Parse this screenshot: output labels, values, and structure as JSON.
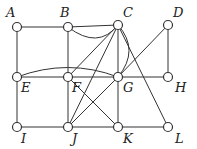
{
  "diagram": {
    "type": "graph",
    "nodes": [
      {
        "id": "A",
        "label": "A",
        "x": 17,
        "y": 27,
        "lx": 6,
        "ly": 17
      },
      {
        "id": "B",
        "label": "B",
        "x": 68,
        "y": 27,
        "lx": 60,
        "ly": 17
      },
      {
        "id": "C",
        "label": "C",
        "x": 118,
        "y": 25,
        "lx": 123,
        "ly": 17
      },
      {
        "id": "D",
        "label": "D",
        "x": 168,
        "y": 25,
        "lx": 173,
        "ly": 17
      },
      {
        "id": "E",
        "label": "E",
        "x": 17,
        "y": 77,
        "lx": 21,
        "ly": 92
      },
      {
        "id": "F",
        "label": "F",
        "x": 68,
        "y": 77,
        "lx": 72,
        "ly": 92
      },
      {
        "id": "G",
        "label": "G",
        "x": 118,
        "y": 77,
        "lx": 123,
        "ly": 92
      },
      {
        "id": "H",
        "label": "H",
        "x": 168,
        "y": 77,
        "lx": 175,
        "ly": 92
      },
      {
        "id": "I",
        "label": "I",
        "x": 17,
        "y": 127,
        "lx": 21,
        "ly": 143
      },
      {
        "id": "J",
        "label": "J",
        "x": 68,
        "y": 127,
        "lx": 72,
        "ly": 143
      },
      {
        "id": "K",
        "label": "K",
        "x": 118,
        "y": 127,
        "lx": 123,
        "ly": 143
      },
      {
        "id": "L",
        "label": "L",
        "x": 168,
        "y": 127,
        "lx": 175,
        "ly": 143
      }
    ],
    "edges": [
      {
        "from": "A",
        "to": "B"
      },
      {
        "from": "B",
        "to": "C"
      },
      {
        "from": "B",
        "to": "C",
        "curved": true,
        "ctrl": [
          98,
          50
        ]
      },
      {
        "from": "A",
        "to": "E"
      },
      {
        "from": "B",
        "to": "F"
      },
      {
        "from": "C",
        "to": "F"
      },
      {
        "from": "C",
        "to": "G"
      },
      {
        "from": "C",
        "to": "G",
        "curved": true,
        "ctrl": [
          140,
          50
        ]
      },
      {
        "from": "C",
        "to": "L"
      },
      {
        "from": "C",
        "to": "J"
      },
      {
        "from": "D",
        "to": "G"
      },
      {
        "from": "D",
        "to": "H"
      },
      {
        "from": "E",
        "to": "F"
      },
      {
        "from": "E",
        "to": "G",
        "curved": true,
        "ctrl": [
          68,
          58
        ]
      },
      {
        "from": "F",
        "to": "G"
      },
      {
        "from": "G",
        "to": "H"
      },
      {
        "from": "E",
        "to": "I"
      },
      {
        "from": "F",
        "to": "J"
      },
      {
        "from": "G",
        "to": "K"
      },
      {
        "from": "F",
        "to": "K"
      },
      {
        "from": "G",
        "to": "J"
      },
      {
        "from": "I",
        "to": "J"
      },
      {
        "from": "J",
        "to": "K"
      },
      {
        "from": "K",
        "to": "L"
      }
    ]
  }
}
